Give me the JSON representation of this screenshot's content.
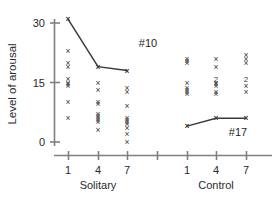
{
  "chart_data": {
    "type": "scatter",
    "title": "",
    "xlabel": "",
    "ylabel": "Level of arousal",
    "ylim": [
      0,
      33
    ],
    "yticks": [
      0,
      15,
      30
    ],
    "ytick_labels": [
      "0",
      "15",
      "30"
    ],
    "grid": false,
    "legend": "none",
    "x_axis": {
      "tick_labels": [
        "1",
        "4",
        "7",
        "",
        "1",
        "4",
        "7"
      ],
      "tick_positions": [
        68,
        98,
        127,
        157,
        187,
        216,
        246
      ],
      "group_labels": [
        "Solitary",
        "Control"
      ]
    },
    "groups": [
      {
        "name": "Solitary",
        "days": [
          {
            "day": "1",
            "x_pixel": 68,
            "values": [
              31,
              23,
              20,
              19,
              16,
              15,
              14.5,
              14,
              10,
              6
            ],
            "duplicates": []
          },
          {
            "day": "4",
            "x_pixel": 98,
            "values": [
              19,
              15,
              13,
              10,
              9.5,
              7,
              6.5,
              6,
              5.5,
              5,
              3
            ],
            "duplicates": []
          },
          {
            "day": "7",
            "x_pixel": 127,
            "values": [
              18,
              13.5,
              12.5,
              9,
              6,
              5.5,
              5,
              4.5,
              3.5,
              2,
              0
            ],
            "duplicates": []
          }
        ]
      },
      {
        "name": "Control",
        "days": [
          {
            "day": "1",
            "x_pixel": 187,
            "values": [
              21,
              20.5,
              20,
              15,
              13.5,
              13,
              12.5,
              12,
              4
            ],
            "duplicates": []
          },
          {
            "day": "4",
            "x_pixel": 216,
            "values": [
              21,
              19,
              16,
              15,
              14.5,
              14,
              12.5,
              12,
              6
            ],
            "duplicates": [
              {
                "value": 16,
                "count": "2"
              }
            ]
          },
          {
            "day": "7",
            "x_pixel": 246,
            "values": [
              22,
              21,
              20,
              16,
              14,
              12.5,
              6
            ],
            "duplicates": [
              {
                "value": 16,
                "count": "2"
              }
            ]
          }
        ]
      }
    ],
    "highlighted_subjects": [
      {
        "id": "#10",
        "label": "#10",
        "group": "Solitary",
        "points": [
          {
            "day": "1",
            "value": 31
          },
          {
            "day": "4",
            "value": 19
          },
          {
            "day": "7",
            "value": 18
          }
        ],
        "label_x": 148,
        "label_y": 47
      },
      {
        "id": "#17",
        "label": "#17",
        "group": "Control",
        "points": [
          {
            "day": "1",
            "value": 4
          },
          {
            "day": "4",
            "value": 6
          },
          {
            "day": "7",
            "value": 6
          }
        ],
        "label_x": 238,
        "label_y": 136
      }
    ],
    "marker_glyph": "×",
    "colors": {
      "axis": "#808080",
      "marker": "#3a3a3a",
      "trace": "#3a3a3a",
      "text": "#2b2b2b",
      "background": "#ffffff"
    }
  }
}
